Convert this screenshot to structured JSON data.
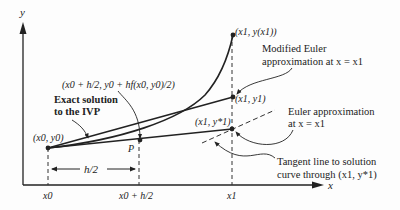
{
  "figure": {
    "axes": {
      "x_label": "x",
      "y_label": "y"
    },
    "points": {
      "start": "(x0, y0)",
      "midpoint": "P",
      "exact_end": "(x1, y(x1))",
      "modified_euler_end": "(x1, y1)",
      "euler_end": "(x1, y*1)"
    },
    "ticks": {
      "x0": "x0",
      "x0_h2": "x0 + h/2",
      "x1": "x1"
    },
    "interval_label": "h/2",
    "annotations": {
      "midpoint_formula": "(x0 + h/2, y0 + hf(x0, y0)/2)",
      "exact_solution_line1": "Exact solution",
      "exact_solution_line2": "to the IVP",
      "modified_euler_line1": "Modified Euler",
      "modified_euler_line2": "approximation at x = x1",
      "euler_line1": "Euler approximation",
      "euler_line2": "at x = x1",
      "tangent_line1": "Tangent line to solution",
      "tangent_line2": "curve through (x1, y*1)"
    }
  }
}
